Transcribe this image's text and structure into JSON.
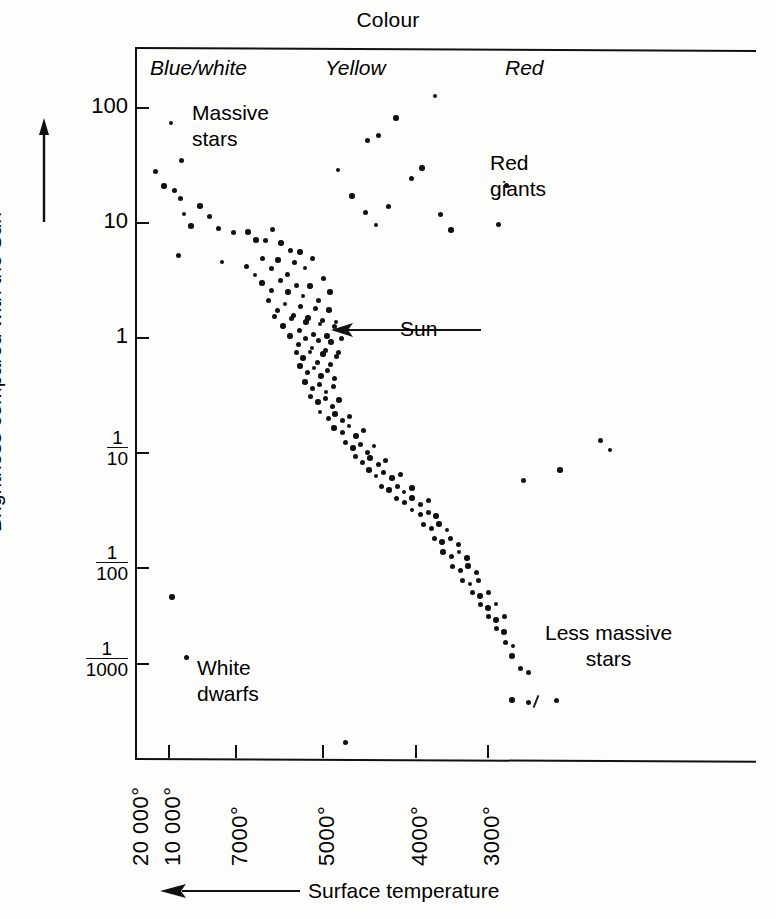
{
  "figure": {
    "title_top": "Colour",
    "xlabel": "Surface temperature",
    "ylabel": "Brightness compared with the Sun"
  },
  "bands": [
    {
      "name": "blue-white",
      "label": "Blue/white",
      "x": 150,
      "y": 56
    },
    {
      "name": "yellow",
      "label": "Yellow",
      "x": 325,
      "y": 56
    },
    {
      "name": "red",
      "label": "Red",
      "x": 505,
      "y": 56
    }
  ],
  "regions": [
    {
      "name": "massive-stars",
      "label": "Massive\nstars",
      "x": 192,
      "y": 100,
      "align": "left"
    },
    {
      "name": "red-giants",
      "label": "Red\ngiants",
      "x": 490,
      "y": 150,
      "align": "left"
    },
    {
      "name": "white-dwarfs",
      "label": "White\ndwarfs",
      "x": 197,
      "y": 655,
      "align": "left"
    },
    {
      "name": "less-massive-stars",
      "label": "Less massive\nstars",
      "x": 545,
      "y": 620,
      "align": "center"
    }
  ],
  "annotations": [
    {
      "name": "sun",
      "label": "Sun",
      "arrow_from_x": 481,
      "arrow_to_x": 333,
      "y": 330
    }
  ],
  "axes": {
    "y_ticks": [
      {
        "label": "100",
        "value": 100,
        "y": 107,
        "type": "plain"
      },
      {
        "label": "10",
        "value": 10,
        "y": 222,
        "type": "plain"
      },
      {
        "label": "1",
        "value": 1,
        "y": 337,
        "type": "plain"
      },
      {
        "label": "1/10",
        "num": "1",
        "den": "10",
        "value": 0.1,
        "y": 452,
        "type": "fraction"
      },
      {
        "label": "1/100",
        "num": "1",
        "den": "100",
        "value": 0.01,
        "y": 567,
        "type": "fraction"
      },
      {
        "label": "1/1000",
        "num": "1",
        "den": "1000",
        "value": 0.001,
        "y": 663,
        "type": "fraction"
      }
    ],
    "x_ticks": [
      {
        "label": "20 000°",
        "value": 20000,
        "x": 136,
        "major": false
      },
      {
        "label": "10 000°",
        "value": 10000,
        "x": 168,
        "major": true
      },
      {
        "label": "7000°",
        "value": 7000,
        "x": 235,
        "major": true
      },
      {
        "label": "5000°",
        "value": 5000,
        "x": 322,
        "major": true
      },
      {
        "label": "4000°",
        "value": 4000,
        "x": 415,
        "major": true
      },
      {
        "label": "3000°",
        "value": 3000,
        "x": 487,
        "major": true
      }
    ]
  },
  "chart_data": {
    "type": "scatter",
    "xlabel": "Surface temperature",
    "ylabel": "Brightness compared with the Sun",
    "x_axis": {
      "label": "Surface temperature",
      "direction": "decreasing left-to-right",
      "scale": "log-like (non-uniform)",
      "ticks": [
        "20 000°",
        "10 000°",
        "7000°",
        "5000°",
        "4000°",
        "3000°"
      ],
      "top_categories": [
        "Blue/white",
        "Yellow",
        "Red"
      ]
    },
    "y_axis": {
      "label": "Brightness compared with the Sun",
      "scale": "log10",
      "ticks": [
        "100",
        "10",
        "1",
        "1/10",
        "1/100",
        "1/1000"
      ],
      "range": [
        0.0005,
        300
      ]
    },
    "grid": false,
    "legend": null,
    "groups": [
      {
        "name": "Massive stars",
        "description": "Upper-left end of the main sequence"
      },
      {
        "name": "Red giants",
        "description": "Upper-right, cool and very bright"
      },
      {
        "name": "White dwarfs",
        "description": "Lower-left, hot and very faint"
      },
      {
        "name": "Less massive stars",
        "description": "Lower-right end of the main sequence"
      },
      {
        "name": "Sun",
        "description": "Main sequence star at brightness 1"
      }
    ],
    "points": [
      [
        171,
        123
      ],
      [
        155,
        171
      ],
      [
        181,
        160
      ],
      [
        164,
        186
      ],
      [
        174,
        190
      ],
      [
        180,
        198
      ],
      [
        200,
        206
      ],
      [
        184,
        214
      ],
      [
        209,
        216
      ],
      [
        191,
        226
      ],
      [
        218,
        228
      ],
      [
        233,
        232
      ],
      [
        256,
        240
      ],
      [
        178,
        255
      ],
      [
        222,
        262
      ],
      [
        248,
        232
      ],
      [
        265,
        240
      ],
      [
        272,
        229
      ],
      [
        281,
        243
      ],
      [
        290,
        250
      ],
      [
        246,
        266
      ],
      [
        255,
        275
      ],
      [
        262,
        258
      ],
      [
        271,
        268
      ],
      [
        278,
        260
      ],
      [
        287,
        274
      ],
      [
        294,
        262
      ],
      [
        300,
        252
      ],
      [
        305,
        268
      ],
      [
        312,
        258
      ],
      [
        262,
        283
      ],
      [
        271,
        290
      ],
      [
        280,
        280
      ],
      [
        288,
        292
      ],
      [
        296,
        285
      ],
      [
        303,
        296
      ],
      [
        310,
        286
      ],
      [
        318,
        300
      ],
      [
        323,
        278
      ],
      [
        330,
        292
      ],
      [
        268,
        300
      ],
      [
        277,
        310
      ],
      [
        285,
        304
      ],
      [
        293,
        315
      ],
      [
        300,
        306
      ],
      [
        308,
        318
      ],
      [
        315,
        308
      ],
      [
        322,
        320
      ],
      [
        329,
        310
      ],
      [
        336,
        322
      ],
      [
        274,
        316
      ],
      [
        283,
        326
      ],
      [
        291,
        318
      ],
      [
        299,
        330
      ],
      [
        306,
        322
      ],
      [
        313,
        334
      ],
      [
        320,
        324
      ],
      [
        327,
        336
      ],
      [
        334,
        326
      ],
      [
        341,
        338
      ],
      [
        290,
        336
      ],
      [
        298,
        344
      ],
      [
        305,
        338
      ],
      [
        312,
        348
      ],
      [
        318,
        340
      ],
      [
        325,
        350
      ],
      [
        331,
        342
      ],
      [
        338,
        352
      ],
      [
        296,
        352
      ],
      [
        303,
        358
      ],
      [
        310,
        352
      ],
      [
        317,
        362
      ],
      [
        323,
        354
      ],
      [
        330,
        364
      ],
      [
        336,
        356
      ],
      [
        300,
        366
      ],
      [
        307,
        372
      ],
      [
        314,
        368
      ],
      [
        321,
        376
      ],
      [
        327,
        370
      ],
      [
        334,
        378
      ],
      [
        305,
        382
      ],
      [
        312,
        388
      ],
      [
        319,
        384
      ],
      [
        326,
        392
      ],
      [
        333,
        386
      ],
      [
        310,
        396
      ],
      [
        318,
        402
      ],
      [
        325,
        398
      ],
      [
        332,
        406
      ],
      [
        339,
        400
      ],
      [
        320,
        412
      ],
      [
        328,
        418
      ],
      [
        335,
        414
      ],
      [
        342,
        420
      ],
      [
        349,
        416
      ],
      [
        334,
        428
      ],
      [
        342,
        432
      ],
      [
        349,
        426
      ],
      [
        356,
        436
      ],
      [
        363,
        430
      ],
      [
        345,
        442
      ],
      [
        353,
        448
      ],
      [
        360,
        444
      ],
      [
        367,
        452
      ],
      [
        374,
        446
      ],
      [
        355,
        456
      ],
      [
        362,
        462
      ],
      [
        370,
        458
      ],
      [
        378,
        464
      ],
      [
        385,
        460
      ],
      [
        369,
        470
      ],
      [
        376,
        476
      ],
      [
        383,
        472
      ],
      [
        392,
        478
      ],
      [
        400,
        474
      ],
      [
        381,
        486
      ],
      [
        389,
        490
      ],
      [
        397,
        486
      ],
      [
        404,
        492
      ],
      [
        412,
        488
      ],
      [
        396,
        498
      ],
      [
        404,
        502
      ],
      [
        412,
        498
      ],
      [
        420,
        504
      ],
      [
        428,
        500
      ],
      [
        412,
        510
      ],
      [
        420,
        514
      ],
      [
        428,
        512
      ],
      [
        436,
        516
      ],
      [
        423,
        524
      ],
      [
        431,
        528
      ],
      [
        439,
        524
      ],
      [
        447,
        530
      ],
      [
        434,
        538
      ],
      [
        442,
        542
      ],
      [
        450,
        538
      ],
      [
        458,
        544
      ],
      [
        443,
        552
      ],
      [
        451,
        556
      ],
      [
        459,
        552
      ],
      [
        467,
        558
      ],
      [
        452,
        566
      ],
      [
        460,
        570
      ],
      [
        468,
        566
      ],
      [
        476,
        572
      ],
      [
        462,
        580
      ],
      [
        470,
        584
      ],
      [
        478,
        580
      ],
      [
        472,
        592
      ],
      [
        480,
        596
      ],
      [
        488,
        592
      ],
      [
        480,
        604
      ],
      [
        488,
        608
      ],
      [
        496,
        604
      ],
      [
        488,
        616
      ],
      [
        496,
        620
      ],
      [
        504,
        616
      ],
      [
        496,
        628
      ],
      [
        504,
        632
      ],
      [
        505,
        642
      ],
      [
        513,
        646
      ],
      [
        512,
        656
      ],
      [
        520,
        668
      ],
      [
        528,
        672
      ],
      [
        512,
        700
      ],
      [
        528,
        702
      ],
      [
        556,
        700
      ],
      [
        338,
        170
      ],
      [
        367,
        140
      ],
      [
        378,
        135
      ],
      [
        396,
        118
      ],
      [
        388,
        206
      ],
      [
        411,
        178
      ],
      [
        422,
        168
      ],
      [
        435,
        96
      ],
      [
        440,
        214
      ],
      [
        451,
        230
      ],
      [
        498,
        224
      ],
      [
        506,
        185
      ],
      [
        352,
        196
      ],
      [
        365,
        212
      ],
      [
        376,
        225
      ],
      [
        172,
        597
      ],
      [
        186,
        657
      ],
      [
        523,
        480
      ],
      [
        560,
        470
      ],
      [
        345,
        742
      ],
      [
        600,
        440
      ],
      [
        610,
        450
      ]
    ],
    "point_count": 185
  }
}
